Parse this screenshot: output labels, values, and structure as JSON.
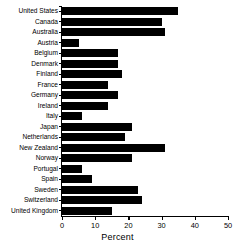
{
  "chart_data": {
    "type": "bar",
    "orientation": "horizontal",
    "title": "",
    "xlabel": "Percent",
    "ylabel": "",
    "xlim": [
      0,
      50
    ],
    "xticks": [
      0,
      10,
      20,
      30,
      40,
      50
    ],
    "xtick_labels": [
      "0",
      "10",
      "20",
      "30",
      "40",
      "50"
    ],
    "grid": false,
    "legend": null,
    "bar_color": "#000000",
    "background_color": "#ffffff",
    "categories": [
      "United States",
      "Canada",
      "Australia",
      "Austria",
      "Belgium",
      "Denmark",
      "Finland",
      "France",
      "Germany",
      "Ireland",
      "Italy",
      "Japan",
      "Netherlands",
      "New Zealand",
      "Norway",
      "Portugal",
      "Spain",
      "Sweden",
      "Switzerland",
      "United Kingdom"
    ],
    "values": [
      35,
      30,
      31,
      5,
      17,
      17,
      18,
      14,
      17,
      14,
      6,
      21,
      19,
      31,
      21,
      6,
      9,
      23,
      24,
      15
    ]
  }
}
